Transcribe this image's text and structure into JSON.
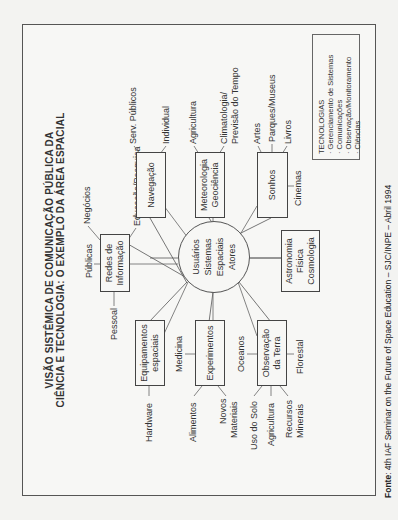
{
  "title": {
    "line1": "VISÃO SISTÊMICA DE COMUNICAÇÃO PÚBLICA DA",
    "line2": "CIÊNCIA E TECNOLOGIA: O EXEMPLO DA ÁREA ESPACIAL"
  },
  "center": {
    "lines": [
      "Usuários",
      "Sistemas",
      "Espaciais",
      "Atores"
    ]
  },
  "nodes": {
    "redes": {
      "label1": "Redes de",
      "label2": "Informação",
      "children": [
        "Públicas",
        "Negócios",
        "Educação/Pesquisa",
        "Pessoal"
      ]
    },
    "navegacao": {
      "label": "Navegação",
      "children": [
        "Serv. Públicos",
        "Individual"
      ]
    },
    "meteorologia": {
      "label1": "Meteorologia",
      "label2": "Geociência",
      "children": [
        "Agricultura",
        "Climatologia/",
        "Previsão do Tempo"
      ]
    },
    "sonhos": {
      "label": "Sonhos",
      "children": [
        "Artes",
        "Parques/Museus",
        "Livros",
        "Cinemas"
      ]
    },
    "astronomia": {
      "label1": "Astronomia",
      "label2": "Física",
      "label3": "Cosmologia"
    },
    "equipamentos": {
      "label1": "Equipamentos",
      "label2": "espaciais",
      "children": [
        "Hardware"
      ]
    },
    "experimentos": {
      "label": "Experimentos",
      "children": [
        "Medicina",
        "Alimentos",
        "Novos",
        "Materiais"
      ]
    },
    "observacao": {
      "label1": "Observação",
      "label2": "da Terra",
      "children": [
        "Oceanos",
        "Florestal",
        "Uso do Solo",
        "Agricultura",
        "Recursos",
        "Minerais"
      ]
    }
  },
  "legend": {
    "heading": "TECNOLOGIAS",
    "items": [
      "· Gerenciamento de Sistemas",
      "· Comunicações",
      "· Observação/Monitoramento",
      "· Ciências"
    ]
  },
  "footer": {
    "label": "Fonte",
    "text": ": 4th IAF Seminar on the Future of Space Education – SJC/INPE – Abril 1994"
  }
}
